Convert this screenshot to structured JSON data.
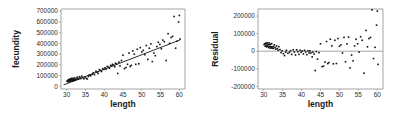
{
  "figure": {
    "background_color": "#ffffff",
    "point_color": "#121212",
    "axis_color": "#8e8e8e",
    "line_color": "#141414",
    "panels": [
      "fecundity-vs-length",
      "residual-vs-length"
    ]
  },
  "chart_data": [
    {
      "type": "scatter",
      "title": "",
      "xlabel": "length",
      "ylabel": "fecundity",
      "xlim": [
        28.5,
        61.5
      ],
      "ylim": [
        -25000,
        720000
      ],
      "xticks": [
        30,
        35,
        40,
        45,
        50,
        55,
        60
      ],
      "xtick_labels": [
        "30",
        "35",
        "40",
        "45",
        "50",
        "55",
        "60"
      ],
      "yticks": [
        0,
        100000,
        200000,
        300000,
        400000,
        500000,
        600000,
        700000
      ],
      "ytick_labels": [
        "0",
        "100000",
        "200000",
        "300000",
        "400000",
        "500000",
        "600000",
        "700000"
      ],
      "grid": false,
      "legend": null,
      "fit_line": {
        "type": "linear-regression",
        "x_start": 29.2,
        "y_start": 13000,
        "x_end": 60.2,
        "y_end": 432000
      },
      "x": [
        30.1,
        30.3,
        30.4,
        30.5,
        30.6,
        30.7,
        30.8,
        30.9,
        31.0,
        31.1,
        31.2,
        31.3,
        31.4,
        31.5,
        31.6,
        31.7,
        31.8,
        31.9,
        32.0,
        32.1,
        32.2,
        32.3,
        32.5,
        32.6,
        32.8,
        33.0,
        33.2,
        33.4,
        33.6,
        33.8,
        34.0,
        34.3,
        34.6,
        34.9,
        35.2,
        35.5,
        35.8,
        36.0,
        36.4,
        36.8,
        37.1,
        37.4,
        37.8,
        38.1,
        38.4,
        38.7,
        39.0,
        39.3,
        39.6,
        39.9,
        40.2,
        40.5,
        40.8,
        41.1,
        41.4,
        41.7,
        42.0,
        42.2,
        42.5,
        42.8,
        43.0,
        43.3,
        43.6,
        43.9,
        44.2,
        44.6,
        45.0,
        45.4,
        45.8,
        46.2,
        46.6,
        46.9,
        47.2,
        47.6,
        48.0,
        48.4,
        48.8,
        49.2,
        49.6,
        50.0,
        50.4,
        50.8,
        51.2,
        51.6,
        52.0,
        52.4,
        52.8,
        53.2,
        53.6,
        54.0,
        54.4,
        54.8,
        55.2,
        55.6,
        56.0,
        56.5,
        57.0,
        57.4,
        57.8,
        58.2,
        58.6,
        59.0,
        59.4,
        59.8,
        60.0,
        60.2
      ],
      "y": [
        48000,
        55000,
        42000,
        60000,
        51000,
        65000,
        45000,
        58000,
        70000,
        52000,
        62000,
        48000,
        75000,
        56000,
        68000,
        50000,
        72000,
        60000,
        55000,
        80000,
        64000,
        58000,
        70000,
        62000,
        85000,
        75000,
        68000,
        90000,
        78000,
        72000,
        95000,
        82000,
        70000,
        88000,
        75000,
        68000,
        92000,
        105000,
        98000,
        112000,
        125000,
        108000,
        140000,
        132000,
        120000,
        155000,
        148000,
        138000,
        165000,
        158000,
        172000,
        160000,
        185000,
        178000,
        168000,
        195000,
        188000,
        205000,
        198000,
        182000,
        215000,
        208000,
        120000,
        225000,
        190000,
        240000,
        290000,
        165000,
        175000,
        205000,
        310000,
        185000,
        195000,
        330000,
        300000,
        205000,
        345000,
        210000,
        360000,
        320000,
        335000,
        295000,
        380000,
        250000,
        355000,
        395000,
        230000,
        310000,
        285000,
        370000,
        410000,
        390000,
        350000,
        430000,
        415000,
        240000,
        490000,
        400000,
        455000,
        465000,
        650000,
        355000,
        420000,
        600000,
        660000,
        440000
      ]
    },
    {
      "type": "scatter",
      "title": "",
      "xlabel": "length",
      "ylabel": "Residual",
      "xlim": [
        28.5,
        61.5
      ],
      "ylim": [
        -215000,
        240000
      ],
      "xticks": [
        30,
        35,
        40,
        45,
        50,
        55,
        60
      ],
      "xtick_labels": [
        "30",
        "35",
        "40",
        "45",
        "50",
        "55",
        "60"
      ],
      "yticks": [
        -200000,
        -100000,
        0,
        100000,
        200000
      ],
      "ytick_labels": [
        "-200000",
        "-100000",
        "0",
        "100000",
        "200000"
      ],
      "grid": false,
      "legend": null,
      "reference_line": {
        "type": "horizontal",
        "y": 0
      },
      "x": [
        30.1,
        30.3,
        30.4,
        30.5,
        30.6,
        30.7,
        30.8,
        30.9,
        31.0,
        31.1,
        31.2,
        31.3,
        31.4,
        31.5,
        31.6,
        31.7,
        31.8,
        31.9,
        32.0,
        32.1,
        32.2,
        32.3,
        32.5,
        32.6,
        32.8,
        33.0,
        33.2,
        33.4,
        33.6,
        33.8,
        34.0,
        34.3,
        34.6,
        34.9,
        35.2,
        35.5,
        35.8,
        36.0,
        36.4,
        36.8,
        37.1,
        37.4,
        37.8,
        38.1,
        38.4,
        38.7,
        39.0,
        39.3,
        39.6,
        39.9,
        40.2,
        40.5,
        40.8,
        41.1,
        41.4,
        41.7,
        42.0,
        42.2,
        42.5,
        42.8,
        43.0,
        43.3,
        43.6,
        43.9,
        44.2,
        44.6,
        45.0,
        45.4,
        45.8,
        46.2,
        46.6,
        46.9,
        47.2,
        47.6,
        48.0,
        48.4,
        48.8,
        49.2,
        49.6,
        50.0,
        50.4,
        50.8,
        51.2,
        51.6,
        52.0,
        52.4,
        52.8,
        53.2,
        53.6,
        54.0,
        54.4,
        54.8,
        55.2,
        55.6,
        56.0,
        56.5,
        57.0,
        57.4,
        57.8,
        58.2,
        58.6,
        59.0,
        59.4,
        59.8,
        60.0,
        60.2
      ],
      "y": [
        38000,
        42000,
        28000,
        44000,
        33000,
        46000,
        25000,
        36000,
        47000,
        28000,
        37000,
        21000,
        48000,
        27000,
        38000,
        18000,
        40000,
        26000,
        19000,
        43000,
        25000,
        17000,
        26000,
        16000,
        36000,
        22000,
        12000,
        30000,
        15000,
        6000,
        26000,
        9000,
        -8000,
        3000,
        -14000,
        -25000,
        -5000,
        5000,
        -12000,
        -6000,
        3000,
        -18000,
        8000,
        -5000,
        -22000,
        8000,
        -3000,
        -18000,
        5000,
        -6000,
        2000,
        -16000,
        5000,
        -5000,
        -20000,
        2000,
        -10000,
        2000,
        -10000,
        -32000,
        -5000,
        -16000,
        -110000,
        -2000,
        -45000,
        -8000,
        42000,
        -88000,
        -85000,
        -62000,
        55000,
        -70000,
        -65000,
        68000,
        30000,
        -72000,
        62000,
        -70000,
        72000,
        28000,
        36000,
        -10000,
        78000,
        -60000,
        42000,
        80000,
        -95000,
        -22000,
        -55000,
        30000,
        68000,
        42000,
        -5000,
        82000,
        62000,
        -125000,
        118000,
        25000,
        72000,
        78000,
        235000,
        -42000,
        22000,
        148000,
        228000,
        -75000
      ]
    }
  ],
  "panels": {
    "fecundity": {
      "name": "fecundity-vs-length",
      "xlabel": "length",
      "ylabel": "fecundity"
    },
    "residual": {
      "name": "residual-vs-length",
      "xlabel": "length",
      "ylabel": "Residual"
    }
  }
}
